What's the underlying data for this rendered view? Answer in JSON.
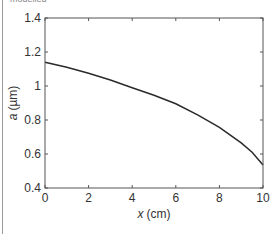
{
  "caption_fragment": "modelled",
  "chart_data": {
    "type": "line",
    "title": "",
    "xlabel_var": "x",
    "xlabel_unit": "(cm)",
    "ylabel_var": "a",
    "ylabel_unit": "(µm)",
    "xlim": [
      0,
      10
    ],
    "ylim": [
      0.4,
      1.4
    ],
    "xticks": [
      "0",
      "2",
      "4",
      "6",
      "8",
      "10"
    ],
    "yticks": [
      "0.4",
      "0.6",
      "0.8",
      "1",
      "1.2",
      "1.4"
    ],
    "grid": false,
    "legend": null,
    "series": [
      {
        "name": "a(x)",
        "color": "#2a2a2a",
        "x": [
          0,
          1,
          2,
          3,
          4,
          5,
          6,
          7,
          8,
          9,
          9.5,
          10
        ],
        "y": [
          1.14,
          1.11,
          1.075,
          1.035,
          0.99,
          0.945,
          0.895,
          0.83,
          0.757,
          0.665,
          0.61,
          0.535
        ]
      }
    ]
  }
}
